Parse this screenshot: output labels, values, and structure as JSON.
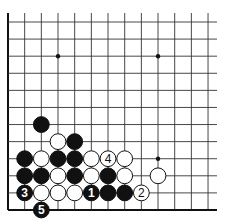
{
  "diagram": {
    "type": "go-board-fragment",
    "grid": {
      "columns": 13,
      "rows": 12,
      "left_edge": true,
      "bottom_edge": true,
      "x0": 8,
      "y0": 22,
      "dx": 16.67,
      "dy": 17.09,
      "right_extend": 217,
      "top_extend": 13
    },
    "star_points": [
      {
        "col": 3,
        "row": 2
      },
      {
        "col": 9,
        "row": 2
      },
      {
        "col": 9,
        "row": 8
      }
    ],
    "stones": [
      {
        "color": "black",
        "col": 2,
        "row": 6,
        "label": ""
      },
      {
        "color": "white",
        "col": 3,
        "row": 7,
        "label": ""
      },
      {
        "color": "black",
        "col": 4,
        "row": 7,
        "label": ""
      },
      {
        "color": "black",
        "col": 1,
        "row": 8,
        "label": ""
      },
      {
        "color": "white",
        "col": 2,
        "row": 8,
        "label": ""
      },
      {
        "color": "black",
        "col": 3,
        "row": 8,
        "label": ""
      },
      {
        "color": "black",
        "col": 4,
        "row": 8,
        "label": ""
      },
      {
        "color": "white",
        "col": 5,
        "row": 8,
        "label": ""
      },
      {
        "color": "white",
        "col": 6,
        "row": 8,
        "label": "4"
      },
      {
        "color": "white",
        "col": 7,
        "row": 8,
        "label": ""
      },
      {
        "color": "black",
        "col": 1,
        "row": 9,
        "label": ""
      },
      {
        "color": "black",
        "col": 2,
        "row": 9,
        "label": ""
      },
      {
        "color": "white",
        "col": 3,
        "row": 9,
        "label": ""
      },
      {
        "color": "black",
        "col": 4,
        "row": 9,
        "label": ""
      },
      {
        "color": "white",
        "col": 5,
        "row": 9,
        "label": ""
      },
      {
        "color": "black",
        "col": 6,
        "row": 9,
        "label": ""
      },
      {
        "color": "white",
        "col": 7,
        "row": 9,
        "label": ""
      },
      {
        "color": "white",
        "col": 9,
        "row": 9,
        "label": ""
      },
      {
        "color": "black",
        "col": 1,
        "row": 10,
        "label": "3"
      },
      {
        "color": "white",
        "col": 2,
        "row": 10,
        "label": ""
      },
      {
        "color": "white",
        "col": 3,
        "row": 10,
        "label": ""
      },
      {
        "color": "white",
        "col": 4,
        "row": 10,
        "label": ""
      },
      {
        "color": "black",
        "col": 5,
        "row": 10,
        "label": "1"
      },
      {
        "color": "black",
        "col": 6,
        "row": 10,
        "label": ""
      },
      {
        "color": "black",
        "col": 7,
        "row": 10,
        "label": ""
      },
      {
        "color": "white",
        "col": 8,
        "row": 10,
        "label": "2"
      },
      {
        "color": "black",
        "col": 2,
        "row": 11,
        "label": "5"
      }
    ],
    "colors": {
      "line": "#333333",
      "edge": "#111111",
      "black_stone": "#111111",
      "white_stone": "#ffffff",
      "stone_outline": "#111111"
    }
  }
}
